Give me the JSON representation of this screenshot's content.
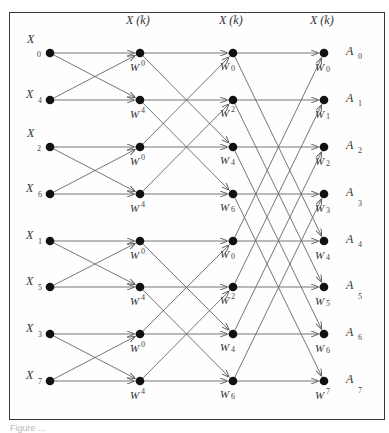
{
  "diagram": {
    "type": "fft-butterfly",
    "stages": [
      {
        "x": 50,
        "header": ""
      },
      {
        "x": 140,
        "header": "X (k)"
      },
      {
        "x": 233,
        "header": "X (k)"
      },
      {
        "x": 324,
        "header": "X (k)"
      }
    ],
    "row_y": [
      53,
      100,
      147,
      194,
      241,
      287,
      334,
      381
    ],
    "inputs": [
      {
        "name": "X",
        "sub": "0"
      },
      {
        "name": "X",
        "sub": "4"
      },
      {
        "name": "X",
        "sub": "2"
      },
      {
        "name": "X",
        "sub": "6"
      },
      {
        "name": "X",
        "sub": "1"
      },
      {
        "name": "X",
        "sub": "5"
      },
      {
        "name": "X",
        "sub": "3"
      },
      {
        "name": "X",
        "sub": "7"
      }
    ],
    "outputs": [
      {
        "name": "A",
        "sub": "0"
      },
      {
        "name": "A",
        "sub": "1"
      },
      {
        "name": "A",
        "sub": "2"
      },
      {
        "name": "A",
        "sub": "3"
      },
      {
        "name": "A",
        "sub": "4"
      },
      {
        "name": "A",
        "sub": "5"
      },
      {
        "name": "A",
        "sub": "6"
      },
      {
        "name": "A",
        "sub": "7"
      }
    ],
    "twiddles": {
      "stage2": [
        "0",
        "4",
        "0",
        "4",
        "0",
        "4",
        "0",
        "4"
      ],
      "stage3": [
        "0",
        "2",
        "4",
        "6",
        "0",
        "2",
        "4",
        "6"
      ],
      "stage4": [
        "0",
        "1",
        "2",
        "3",
        "4",
        "5",
        "6",
        "7"
      ]
    },
    "twiddle_symbol": "W",
    "butterfly_spans": {
      "stage1to2": 1,
      "stage2to3": 2,
      "stage3to4": 4
    }
  },
  "caption": "Figure ..."
}
